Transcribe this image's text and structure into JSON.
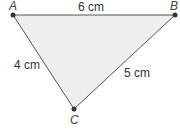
{
  "diagram": {
    "type": "triangle",
    "fill_color": "#eeeeee",
    "stroke_color": "#555555",
    "vertices": [
      {
        "label": "A",
        "x": 13,
        "y": 15
      },
      {
        "label": "B",
        "x": 175,
        "y": 15
      },
      {
        "label": "C",
        "x": 74,
        "y": 109
      }
    ],
    "sides": [
      {
        "from": "A",
        "to": "B",
        "label": "6 cm"
      },
      {
        "from": "A",
        "to": "C",
        "label": "4 cm"
      },
      {
        "from": "B",
        "to": "C",
        "label": "5 cm"
      }
    ]
  }
}
